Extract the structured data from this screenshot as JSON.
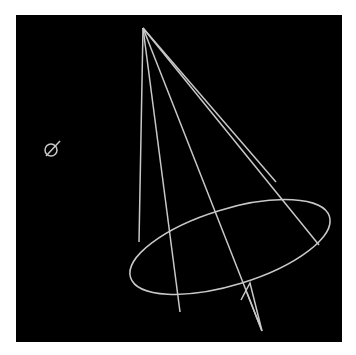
{
  "figure": {
    "background": "#000000",
    "line_color": "#c8c8c8",
    "marker_icon": "origin-marker",
    "cone": {
      "apex": [
        143,
        28
      ],
      "base_ellipse": {
        "cx": 230,
        "cy": 247,
        "rx": 104,
        "ry": 38,
        "rotation_deg": -17
      },
      "generators": [
        [
          140,
          243
        ],
        [
          180,
          313
        ],
        [
          262,
          330
        ],
        [
          318,
          245
        ],
        [
          276,
          182
        ]
      ]
    }
  }
}
